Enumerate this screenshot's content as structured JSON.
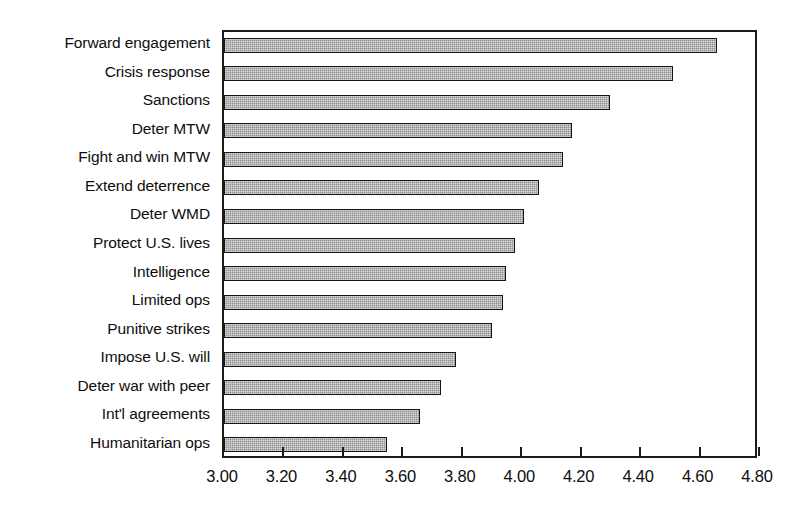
{
  "chart_data": {
    "type": "bar",
    "orientation": "horizontal",
    "title": "",
    "subtitle": "",
    "xlabel": "",
    "ylabel": "",
    "xlim": [
      3.0,
      4.8
    ],
    "xticks": [
      "3.00",
      "3.20",
      "3.40",
      "3.60",
      "3.80",
      "4.00",
      "4.20",
      "4.40",
      "4.60",
      "4.80"
    ],
    "xtick_values": [
      3.0,
      3.2,
      3.4,
      3.6,
      3.8,
      4.0,
      4.2,
      4.4,
      4.6,
      4.8
    ],
    "grid": false,
    "legend": null,
    "legend_position": "none",
    "bar_fill_color": "#8d8d8d",
    "bar_edge_color": "#141414",
    "axis_color": "#1a1a1a",
    "background_color": "#ffffff",
    "categories": [
      "Forward engagement",
      "Crisis response",
      "Sanctions",
      "Deter MTW",
      "Fight and win MTW",
      "Extend deterrence",
      "Deter WMD",
      "Protect U.S. lives",
      "Intelligence",
      "Limited ops",
      "Punitive strikes",
      "Impose U.S. will",
      "Deter war with peer",
      "Int'l agreements",
      "Humanitarian ops"
    ],
    "values": [
      4.66,
      4.51,
      4.3,
      4.17,
      4.14,
      4.06,
      4.01,
      3.98,
      3.95,
      3.94,
      3.9,
      3.78,
      3.73,
      3.66,
      3.55
    ]
  }
}
